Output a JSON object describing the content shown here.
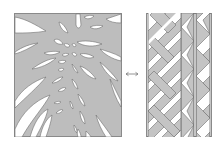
{
  "figure": {
    "left_panel": {
      "label": "organic-pattern",
      "fill_color": "#bdbdbd",
      "cutout_color": "#ffffff",
      "stroke_color": "#6e6e6e",
      "border_color": "#8a8a8a"
    },
    "connector": {
      "glyph": "double-arrow",
      "color": "#7a7a7a"
    },
    "right_panel": {
      "label": "geometric-pattern",
      "fill_color": "#c4c4c4",
      "gap_color": "#ffffff",
      "stroke_color": "#6e6e6e",
      "border_color": "#8a8a8a",
      "columns": [
        "herringbone-stripes",
        "zigzag-triangles",
        "zigzag-triangles"
      ]
    }
  }
}
